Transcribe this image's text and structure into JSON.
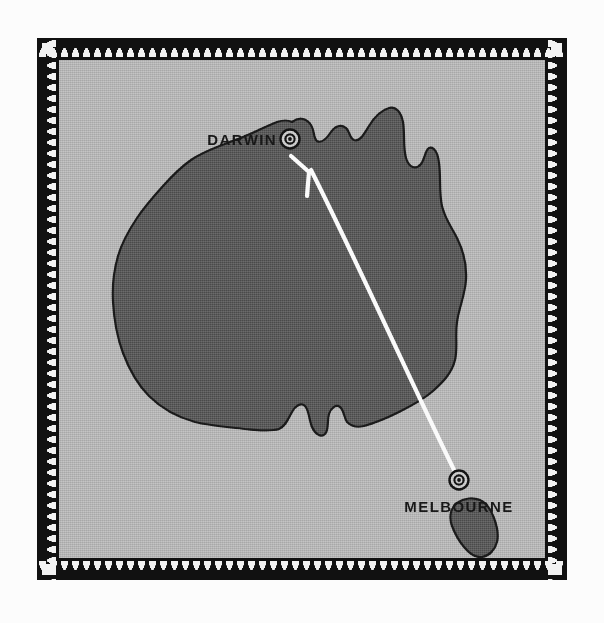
{
  "poster": {
    "title": "Australia route map",
    "background_color": "#fcfcfc"
  },
  "frame": {
    "name": "decorative-sawtooth-border",
    "band_color": "#111111",
    "tooth_color": "#f2f2f2",
    "corner_square_color": "#f2f2f2"
  },
  "map": {
    "plate_color": "#b4b4b4",
    "land_fill": "#585858",
    "land_outline": "#1a1a1a",
    "regions": [
      {
        "name": "mainland-australia"
      },
      {
        "name": "tasmania"
      }
    ]
  },
  "cities": [
    {
      "id": "darwin",
      "label": "DARWIN",
      "marker_icon": "target-circle-icon",
      "label_position": "left"
    },
    {
      "id": "melbourne",
      "label": "MELBOURNE",
      "marker_icon": "target-circle-icon",
      "label_position": "below"
    }
  ],
  "route": {
    "name": "melbourne-to-darwin-route",
    "from": "MELBOURNE",
    "to": "DARWIN",
    "line_color": "#fafafa",
    "arrow_head": "chevron-arrow-icon"
  }
}
